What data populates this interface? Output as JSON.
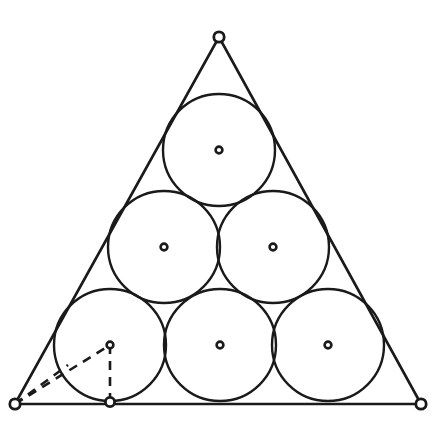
{
  "figure": {
    "background_color": "#ffffff",
    "stroke_color": "#1a1a1a",
    "canvas": {
      "width": 441,
      "height": 421
    }
  },
  "triangle": {
    "name": "outer-triangle",
    "vertices": [
      {
        "label": "apex",
        "x": 219,
        "y": 37
      },
      {
        "label": "bottom-left",
        "x": 15,
        "y": 404
      },
      {
        "label": "bottom-right",
        "x": 421,
        "y": 404
      }
    ],
    "path": "M 219 37 L 15 404 L 421 404 Z"
  },
  "circles": {
    "radius": 56,
    "count": 6,
    "rows": [
      {
        "row_label": "top-row",
        "items": [
          {
            "label": "circle-top",
            "cx": 219,
            "cy": 150
          }
        ]
      },
      {
        "row_label": "middle-row",
        "items": [
          {
            "label": "circle-middle-left",
            "cx": 164,
            "cy": 247
          },
          {
            "label": "circle-middle-right",
            "cx": 273,
            "cy": 247
          }
        ]
      },
      {
        "row_label": "bottom-row",
        "items": [
          {
            "label": "circle-bottom-left",
            "cx": 110,
            "cy": 345
          },
          {
            "label": "circle-bottom-middle",
            "cx": 220,
            "cy": 345
          },
          {
            "label": "circle-bottom-right",
            "cx": 328,
            "cy": 345
          }
        ]
      }
    ],
    "flat": [
      {
        "label": "circle-top",
        "cx": 219,
        "cy": 150,
        "r": 56
      },
      {
        "label": "circle-middle-left",
        "cx": 164,
        "cy": 247,
        "r": 56
      },
      {
        "label": "circle-middle-right",
        "cx": 273,
        "cy": 247,
        "r": 56
      },
      {
        "label": "circle-bottom-left",
        "cx": 110,
        "cy": 345,
        "r": 56
      },
      {
        "label": "circle-bottom-middle",
        "cx": 220,
        "cy": 345,
        "r": 56
      },
      {
        "label": "circle-bottom-right",
        "cx": 328,
        "cy": 345,
        "r": 56
      }
    ]
  },
  "construction": {
    "lines": [
      {
        "label": "vertex-to-center",
        "from": {
          "x": 15,
          "y": 404
        },
        "to": {
          "x": 110,
          "y": 345
        },
        "style": "dashed"
      },
      {
        "label": "vertex-to-tangency-left-side",
        "from": {
          "x": 15,
          "y": 404
        },
        "to": {
          "x": 68,
          "y": 365
        },
        "style": "dashed"
      },
      {
        "label": "radius-to-base",
        "from": {
          "x": 110,
          "y": 345
        },
        "to": {
          "x": 110,
          "y": 402
        },
        "style": "dashed"
      }
    ]
  },
  "markers": {
    "vertex_radius": 5.2,
    "center_radius": 3.4,
    "tangency_radius": 4.6,
    "vertices": [
      {
        "label": "vertex-marker-apex",
        "cx": 219,
        "cy": 37
      },
      {
        "label": "vertex-marker-bottom-left",
        "cx": 15,
        "cy": 404
      },
      {
        "label": "vertex-marker-bottom-right",
        "cx": 421,
        "cy": 404
      }
    ],
    "tangency_points": [
      {
        "label": "tangency-marker-base",
        "cx": 110,
        "cy": 402
      }
    ]
  },
  "chart_data": {
    "type": "scatter",
    "xlabel": "",
    "ylabel": "",
    "xlim": [
      0,
      441
    ],
    "ylim": [
      421,
      0
    ],
    "grid": false,
    "legend_position": "none",
    "annotations": [
      "Triangle vertices marked with open circles",
      "Each circle centre marked with a small open circle",
      "Dashed lines: vertex to centre, vertex to side tangency, centre to base tangency"
    ],
    "series": [
      {
        "name": "circle centres",
        "x": [
          219,
          164,
          273,
          110,
          220,
          328
        ],
        "y": [
          150,
          247,
          247,
          345,
          345,
          345
        ],
        "radius": 56
      },
      {
        "name": "triangle vertices",
        "x": [
          219,
          15,
          421
        ],
        "y": [
          37,
          404,
          404
        ]
      },
      {
        "name": "tangency points",
        "x": [
          110
        ],
        "y": [
          402
        ]
      }
    ]
  }
}
